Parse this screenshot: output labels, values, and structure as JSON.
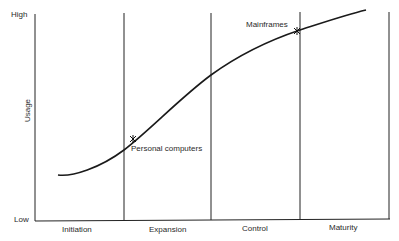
{
  "diagram": {
    "y_axis": {
      "label": "Usage",
      "top_label": "High",
      "bottom_label": "Low"
    },
    "stages": [
      {
        "label": "Initiation"
      },
      {
        "label": "Expansion"
      },
      {
        "label": "Control"
      },
      {
        "label": "Maturity"
      }
    ],
    "markers": [
      {
        "label": "Personal computers"
      },
      {
        "label": "Mainframes"
      }
    ]
  }
}
